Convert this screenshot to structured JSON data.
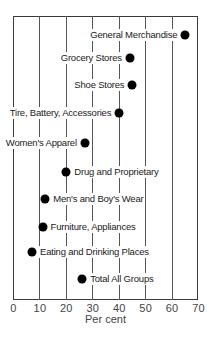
{
  "chart_data": {
    "type": "scatter",
    "style": "dot-plot",
    "title": "",
    "xlabel": "Per cent",
    "ylabel": "",
    "xlim": [
      0,
      70
    ],
    "xticks": [
      0,
      10,
      20,
      30,
      40,
      50,
      60,
      70
    ],
    "grid": true,
    "legend": null,
    "categories": [
      "General Merchandise",
      "Grocery Stores",
      "Shoe Stores",
      "Tire, Battery, Accessories",
      "Women's Apparel",
      "Drug and Proprietary",
      "Men's and Boy's Wear",
      "Furniture, Appliances",
      "Eating and Drinking Places",
      "Total All Groups"
    ],
    "values": [
      65,
      44,
      45,
      40,
      27,
      20,
      12,
      11,
      7,
      26
    ],
    "points": [
      {
        "label": "General Merchandise",
        "value": 65,
        "label_side": "left"
      },
      {
        "label": "Grocery Stores",
        "value": 44,
        "label_side": "left"
      },
      {
        "label": "Shoe Stores",
        "value": 45,
        "label_side": "left"
      },
      {
        "label": "Tire, Battery, Accessories",
        "value": 40,
        "label_side": "left"
      },
      {
        "label": "Women's Apparel",
        "value": 27,
        "label_side": "left"
      },
      {
        "label": "Drug and Proprietary",
        "value": 20,
        "label_side": "right"
      },
      {
        "label": "Men's and Boy's Wear",
        "value": 12,
        "label_side": "right"
      },
      {
        "label": "Furniture, Appliances",
        "value": 11,
        "label_side": "right"
      },
      {
        "label": "Eating and Drinking Places",
        "value": 7,
        "label_side": "right"
      },
      {
        "label": "Total All Groups",
        "value": 26,
        "label_side": "right"
      }
    ]
  },
  "colors": {
    "dot": "#000000",
    "grid": "#555555",
    "text": "#1a1a1a"
  }
}
